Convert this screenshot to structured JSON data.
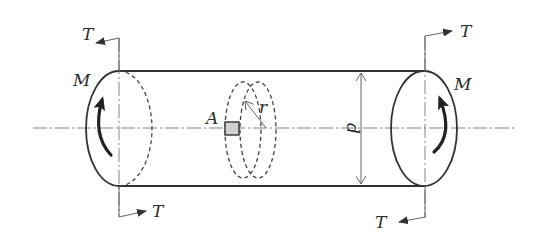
{
  "figure": {
    "labels": {
      "torque_top_left": "T",
      "torque_bottom_left": "T",
      "torque_top_right": "T",
      "torque_bottom_right": "T",
      "moment_left": "M",
      "moment_right": "M",
      "element": "A",
      "radius": "r",
      "diameter": "d"
    },
    "colors": {
      "stroke": "#333333",
      "element_fill": "#cfcfcf",
      "background": "#ffffff"
    }
  }
}
